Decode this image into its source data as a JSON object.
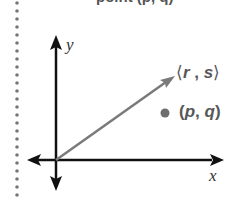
{
  "header": {
    "cropped_text": "point (p, q)"
  },
  "diagram": {
    "axes": {
      "x_label": "x",
      "y_label": "y"
    },
    "vector": {
      "label_open": "⟨",
      "label_r": "r",
      "label_sep": " , ",
      "label_s": "s",
      "label_close": "⟩",
      "color": "#7a7a7a"
    },
    "point": {
      "label_open": "(",
      "label_p": "p",
      "label_sep": ", ",
      "label_q": "q",
      "label_close": ")",
      "color": "#6e6e70"
    },
    "colors": {
      "axis": "#111111",
      "dotted_rule": "#777777",
      "text": "#58585a"
    }
  }
}
